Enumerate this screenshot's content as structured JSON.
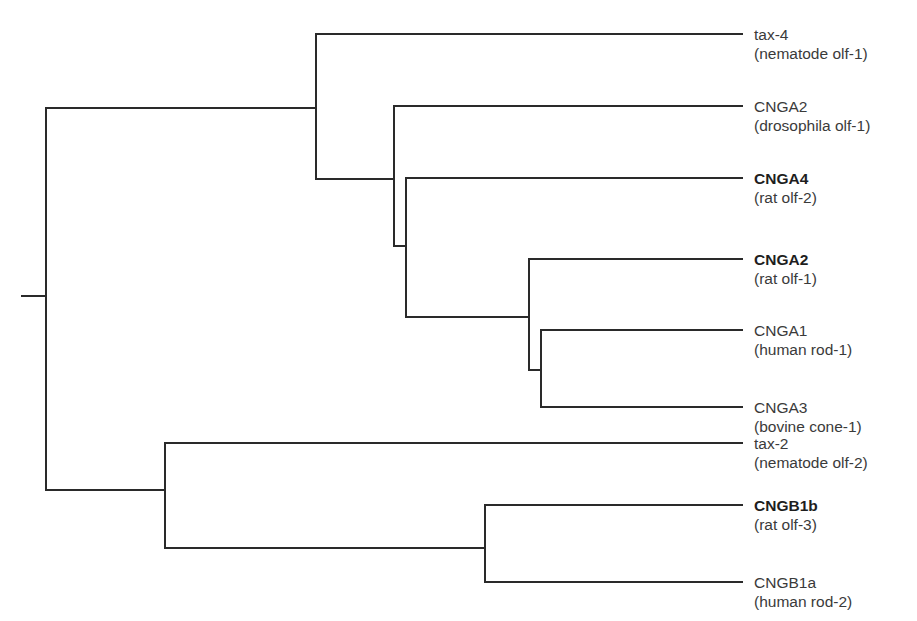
{
  "diagram": {
    "type": "phylogenetic-tree",
    "line_color": "#2a2a2a",
    "text_color": "#3a3a3a",
    "leaves": [
      {
        "name": "tax-4",
        "sub": "(nematode olf-1)",
        "bold": false,
        "y": 34
      },
      {
        "name": "CNGA2",
        "sub": "(drosophila olf-1)",
        "bold": false,
        "y": 106
      },
      {
        "name": "CNGA4",
        "sub": "(rat olf-2)",
        "bold": true,
        "y": 178
      },
      {
        "name": "CNGA2",
        "sub": "(rat olf-1)",
        "bold": true,
        "y": 259
      },
      {
        "name": "CNGA1",
        "sub": "(human rod-1)",
        "bold": false,
        "y": 330
      },
      {
        "name": "CNGA3",
        "sub": "(bovine cone-1)",
        "bold": false,
        "y": 407
      },
      {
        "name": "tax-2",
        "sub": "(nematode olf-2)",
        "bold": false,
        "y": 443
      },
      {
        "name": "CNGB1b",
        "sub": "(rat olf-3)",
        "bold": true,
        "y": 505
      },
      {
        "name": "CNGB1a",
        "sub": "(human rod-2)",
        "bold": false,
        "y": 582
      }
    ],
    "newick": "((tax-4,(CNGA2_drosophila,(CNGA4,(CNGA2_rat,(CNGA1,CNGA3))))),(tax-2,(CNGB1b,CNGB1a)));"
  }
}
